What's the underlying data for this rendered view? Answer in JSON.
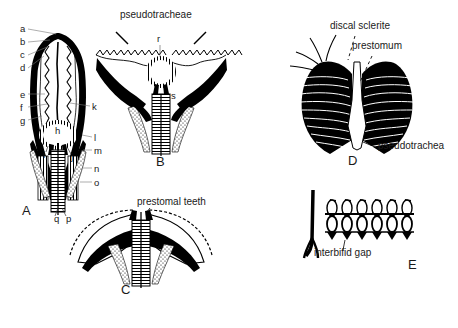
{
  "figure": {
    "background_color": "#ffffff",
    "ink_color": "#000000",
    "width": 458,
    "height": 328
  },
  "panels": [
    {
      "id": "A",
      "letter": "A",
      "caption": "Ventral view of labellum with pseudotracheal framework",
      "letter_pos": {
        "x": 22,
        "y": 212
      }
    },
    {
      "id": "B",
      "letter": "B",
      "caption": "Labellum spread open showing pseudotracheae",
      "letter_pos": {
        "x": 156,
        "y": 163
      }
    },
    {
      "id": "C",
      "letter": "C",
      "caption": "Labellum with prestomal teeth exposed",
      "letter_pos": {
        "x": 121,
        "y": 284
      }
    },
    {
      "id": "D",
      "letter": "D",
      "caption": "Labellar lobes, discal sclerite and prestomum",
      "letter_pos": {
        "x": 348,
        "y": 161
      }
    },
    {
      "id": "E",
      "letter": "E",
      "caption": "Pseudotracheal rings with interbifid gap",
      "letter_pos": {
        "x": 408,
        "y": 265
      }
    }
  ],
  "key_letters": [
    {
      "text": "a",
      "x": 20,
      "y": 30
    },
    {
      "text": "b",
      "x": 20,
      "y": 43
    },
    {
      "text": "c",
      "x": 20,
      "y": 56
    },
    {
      "text": "d",
      "x": 20,
      "y": 69
    },
    {
      "text": "e",
      "x": 20,
      "y": 96
    },
    {
      "text": "f",
      "x": 20,
      "y": 109
    },
    {
      "text": "g",
      "x": 20,
      "y": 122
    },
    {
      "text": "h",
      "x": 57,
      "y": 130
    },
    {
      "text": "i",
      "x": 44,
      "y": 155
    },
    {
      "text": "j",
      "x": 72,
      "y": 157
    },
    {
      "text": "k",
      "x": 93,
      "y": 108
    },
    {
      "text": "l",
      "x": 95,
      "y": 139
    },
    {
      "text": "m",
      "x": 95,
      "y": 152
    },
    {
      "text": "n",
      "x": 95,
      "y": 170
    },
    {
      "text": "o",
      "x": 95,
      "y": 184
    },
    {
      "text": "q",
      "x": 56,
      "y": 220
    },
    {
      "text": "p",
      "x": 68,
      "y": 220
    },
    {
      "text": "r",
      "x": 158,
      "y": 40
    },
    {
      "text": "s",
      "x": 172,
      "y": 97
    }
  ],
  "annotations": [
    {
      "id": "pseudotracheae",
      "text": "pseudotracheae",
      "x": 120,
      "y": 16
    },
    {
      "id": "prestomal-teeth",
      "text": "prestomal teeth",
      "x": 137,
      "y": 203
    },
    {
      "id": "discal-sclerite",
      "text": "discal sclerite",
      "x": 330,
      "y": 27
    },
    {
      "id": "prestomum",
      "text": "prestomum",
      "x": 352,
      "y": 47
    },
    {
      "id": "pseudotrachea",
      "text": "pseudotrachea",
      "x": 378,
      "y": 147
    },
    {
      "id": "interbifid-gap",
      "text": "interbifid gap",
      "x": 314,
      "y": 254
    }
  ]
}
